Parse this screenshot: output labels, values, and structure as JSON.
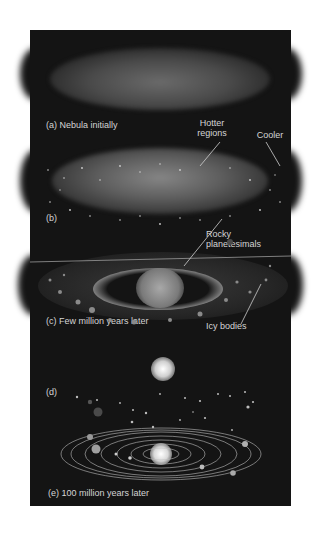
{
  "figure": {
    "panels": [
      {
        "id": "a",
        "label": "(a) Nebula initially"
      },
      {
        "id": "b",
        "label": "(b)"
      },
      {
        "id": "c",
        "label": "(c) Few million years later"
      },
      {
        "id": "d",
        "label": "(d)"
      },
      {
        "id": "e",
        "label": "(e) 100 million years later"
      }
    ],
    "callouts": {
      "hotter": "Hotter\nregions",
      "hotter_1": "Hotter",
      "hotter_2": "regions",
      "cooler": "Cooler",
      "rocky_1": "Rocky",
      "rocky_2": "planetesimals",
      "icy": "Icy bodies"
    },
    "colors": {
      "background": "#141414",
      "page": "#ffffff",
      "text": "#d4d4d4"
    }
  }
}
